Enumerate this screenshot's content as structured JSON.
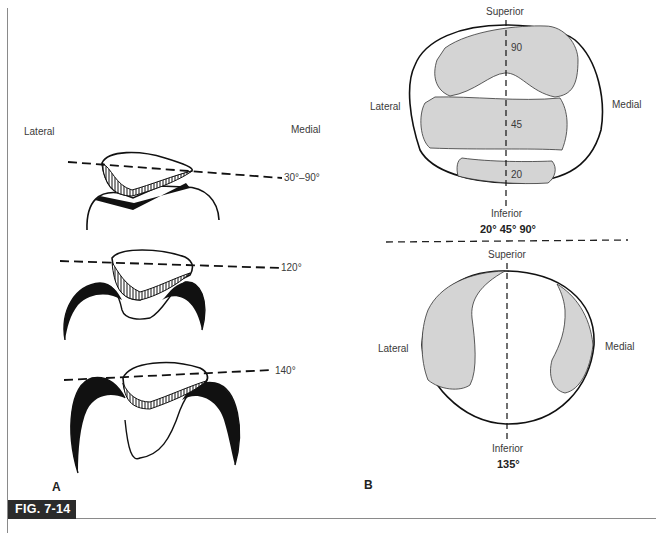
{
  "figure": {
    "label": "FIG. 7-14"
  },
  "panel_a": {
    "letter": "A",
    "lateral_label": "Lateral",
    "medial_label": "Medial",
    "views": [
      {
        "angle_label": "30°–90°"
      },
      {
        "angle_label": "120°"
      },
      {
        "angle_label": "140°"
      }
    ]
  },
  "panel_b": {
    "letter": "B",
    "top_diagram": {
      "superior_label": "Superior",
      "inferior_label": "Inferior",
      "lateral_label": "Lateral",
      "medial_label": "Medial",
      "zones": [
        {
          "label": "90"
        },
        {
          "label": "45"
        },
        {
          "label": "20"
        }
      ],
      "angles_caption": "20° 45° 90°"
    },
    "bottom_diagram": {
      "superior_label": "Superior",
      "inferior_label": "Inferior",
      "lateral_label": "Lateral",
      "medial_label": "Medial",
      "angle_caption": "135°"
    }
  },
  "colors": {
    "contact_fill": "#d4d4d4",
    "ink": "#111111",
    "badge": "#2b2b2b"
  }
}
